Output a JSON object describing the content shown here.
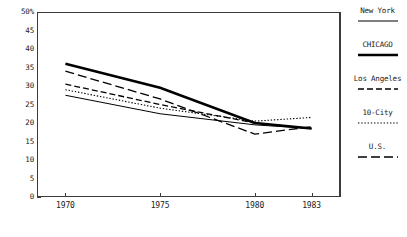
{
  "chart_data": {
    "type": "line",
    "title": "",
    "xlabel": "",
    "ylabel": "",
    "x": [
      1970,
      1975,
      1980,
      1983
    ],
    "xtick_labels": [
      "1970",
      "1975",
      "1980",
      "1983"
    ],
    "xlim": [
      1968.5,
      1984.5
    ],
    "ylim": [
      0,
      50
    ],
    "ytick_labels": [
      "50%",
      "45",
      "40",
      "35",
      "30",
      "25",
      "20",
      "15",
      "10",
      "5",
      "0"
    ],
    "ytick_values": [
      50,
      45,
      40,
      35,
      30,
      25,
      20,
      15,
      10,
      5,
      0
    ],
    "grid": false,
    "legend_position": "right",
    "series": [
      {
        "name": "New York",
        "style": "solid-thin",
        "color": "#000000",
        "values": [
          27.5,
          22.5,
          19.5,
          18.5
        ]
      },
      {
        "name": "CHICAGO",
        "style": "solid-thick",
        "color": "#000000",
        "values": [
          36.0,
          29.5,
          20.0,
          18.5
        ]
      },
      {
        "name": "Los Angeles",
        "style": "dashed-medium",
        "color": "#000000",
        "values": [
          30.5,
          25.0,
          20.0,
          18.5
        ]
      },
      {
        "name": "10-City",
        "style": "dotted",
        "color": "#000000",
        "values": [
          29.0,
          24.0,
          20.5,
          21.5
        ]
      },
      {
        "name": "U.S.",
        "style": "dashed-long",
        "color": "#000000",
        "values": [
          34.0,
          26.5,
          17.0,
          19.0
        ]
      }
    ]
  },
  "legend": {
    "entries": [
      {
        "label": "New York"
      },
      {
        "label": "CHICAGO"
      },
      {
        "label": "Los Angeles"
      },
      {
        "label": "10-City"
      },
      {
        "label": "U.S."
      }
    ]
  },
  "axes": {
    "y_labels": [
      "50%",
      "45",
      "40",
      "35",
      "30",
      "25",
      "20",
      "15",
      "10",
      "5",
      "0"
    ],
    "x_labels": [
      "1970",
      "1975",
      "1980",
      "1983"
    ]
  }
}
